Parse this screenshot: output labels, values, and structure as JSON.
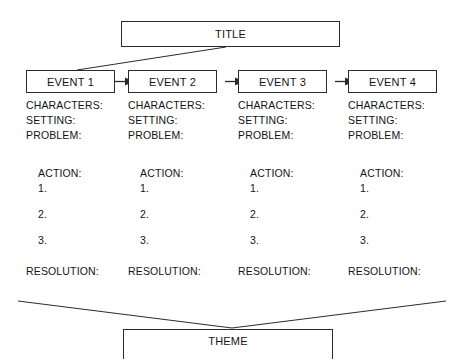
{
  "diagram": {
    "type": "story-map-graphic-organizer",
    "title_node": {
      "label": "TITLE"
    },
    "theme_node": {
      "label": "THEME"
    },
    "field_labels": {
      "characters": "CHARACTERS:",
      "setting": "SETTING:",
      "problem": "PROBLEM:",
      "action": "ACTION:",
      "action_1": "1.",
      "action_2": "2.",
      "action_3": "3.",
      "resolution": "RESOLUTION:"
    },
    "columns": [
      {
        "event_label": "EVENT 1"
      },
      {
        "event_label": "EVENT 2"
      },
      {
        "event_label": "EVENT 3"
      },
      {
        "event_label": "EVENT 4"
      }
    ],
    "connectors": {
      "title_to_event1": "diagonal-line",
      "event_to_event_arrow": "right-arrow",
      "resolutions_to_theme": "v-shaped-lines"
    },
    "colors": {
      "background": "#ffffff",
      "stroke": "#2b2b2b",
      "text": "#141414"
    }
  }
}
